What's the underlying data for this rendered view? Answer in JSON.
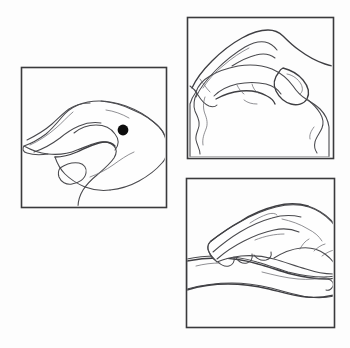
{
  "figure": {
    "title": "Acupressure point on the hand: location and self-massage technique",
    "type": "line-art-illustration",
    "width": 350,
    "height": 348,
    "background_color": "#fdfdfd",
    "frame_color": "#3a3a3c",
    "line_color": "#4a4a4e",
    "marker_color": "#0d0d0d",
    "panel_count": 3
  },
  "panels": [
    {
      "id": "panel-1",
      "name": "point-location-panel",
      "position": "left",
      "label": "Panel 1",
      "description": "Side view of a relaxed right hand, fingers extended to the left and thumb hanging below, with a solid black dot marking the acupressure point on the back of the hand between the thumb and index finger.",
      "bounds": {
        "x": 21,
        "y": 67,
        "width": 145,
        "height": 140
      },
      "marker": {
        "name": "acupressure-point-dot",
        "shape": "filled-circle",
        "center_x": 123,
        "center_y": 130,
        "radius": 5.4,
        "color": "#0d0d0d"
      }
    },
    {
      "id": "panel-2",
      "name": "thumb-press-panel",
      "position": "top-right",
      "label": "Panel 2",
      "description": "Close view of one hand pressing the web between thumb and index finger of the other hand, fingers curled over the top.",
      "bounds": {
        "x": 187,
        "y": 17,
        "width": 146,
        "height": 141
      },
      "marker": null
    },
    {
      "id": "panel-3",
      "name": "hand-cradle-panel",
      "position": "bottom-right",
      "label": "Panel 3",
      "description": "One hand resting on and kneading the open palm of the other hand held horizontally.",
      "bounds": {
        "x": 186,
        "y": 178,
        "width": 148,
        "height": 149
      },
      "marker": null
    }
  ]
}
